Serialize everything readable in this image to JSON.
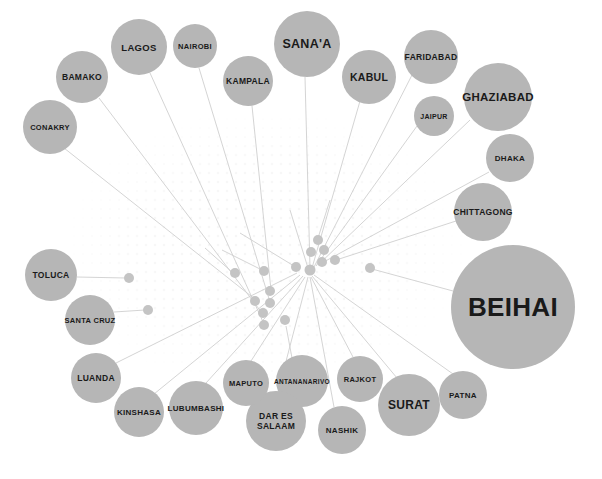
{
  "figure": {
    "type": "network-bubble-diagram",
    "width": 602,
    "height": 479,
    "background_color": "#ffffff",
    "node_color": "#b6b6b6",
    "minor_node_color": "#c4c4c4",
    "edge_color": "#cfcfcf",
    "label_color": "#1a1a1a"
  },
  "chart_data": {
    "type": "scatter",
    "title": "",
    "xlabel": "",
    "ylabel": "",
    "legend": [],
    "grid": false,
    "nodes": [
      {
        "label": "CONAKRY",
        "cx": 50,
        "cy": 127,
        "r": 27,
        "font": 7.5
      },
      {
        "label": "BAMAKO",
        "cx": 82,
        "cy": 77,
        "r": 26,
        "font": 8.5
      },
      {
        "label": "LAGOS",
        "cx": 139,
        "cy": 47,
        "r": 28,
        "font": 9.5
      },
      {
        "label": "NAIROBI",
        "cx": 195,
        "cy": 46,
        "r": 22,
        "font": 7.5
      },
      {
        "label": "KAMPALA",
        "cx": 248,
        "cy": 81,
        "r": 25,
        "font": 8.5
      },
      {
        "label": "SANA'A",
        "cx": 307,
        "cy": 44,
        "r": 33,
        "font": 12.5
      },
      {
        "label": "KABUL",
        "cx": 369,
        "cy": 77,
        "r": 27,
        "font": 10.5
      },
      {
        "label": "FARIDABAD",
        "cx": 431,
        "cy": 57,
        "r": 27,
        "font": 8.5
      },
      {
        "label": "JAIPUR",
        "cx": 434,
        "cy": 116,
        "r": 20,
        "font": 7.0
      },
      {
        "label": "GHAZIABAD",
        "cx": 498,
        "cy": 97,
        "r": 34,
        "font": 11.5
      },
      {
        "label": "DHAKA",
        "cx": 510,
        "cy": 158,
        "r": 24,
        "font": 8.0
      },
      {
        "label": "CHITTAGONG",
        "cx": 483,
        "cy": 212,
        "r": 29,
        "font": 8.5
      },
      {
        "label": "BEIHAI",
        "cx": 513,
        "cy": 307,
        "r": 62,
        "font": 26.0
      },
      {
        "label": "PATNA",
        "cx": 463,
        "cy": 395,
        "r": 24,
        "font": 8.0
      },
      {
        "label": "SURAT",
        "cx": 409,
        "cy": 405,
        "r": 31,
        "font": 12.0
      },
      {
        "label": "RAJKOT",
        "cx": 360,
        "cy": 379,
        "r": 23,
        "font": 7.5
      },
      {
        "label": "NASHIK",
        "cx": 342,
        "cy": 430,
        "r": 24,
        "font": 8.0
      },
      {
        "label": "ANTANANARIVO",
        "cx": 302,
        "cy": 381,
        "r": 26,
        "font": 6.5
      },
      {
        "label": "DAR ES SALAAM",
        "cx": 276,
        "cy": 421,
        "r": 30,
        "font": 8.5
      },
      {
        "label": "MAPUTO",
        "cx": 246,
        "cy": 383,
        "r": 23,
        "font": 7.5
      },
      {
        "label": "LUBUMBASHI",
        "cx": 196,
        "cy": 408,
        "r": 27,
        "font": 8.0
      },
      {
        "label": "KINSHASA",
        "cx": 139,
        "cy": 412,
        "r": 25,
        "font": 8.0
      },
      {
        "label": "LUANDA",
        "cx": 96,
        "cy": 378,
        "r": 25,
        "font": 8.5
      },
      {
        "label": "SANTA CRUZ",
        "cx": 90,
        "cy": 320,
        "r": 25,
        "font": 7.5
      },
      {
        "label": "TOLUCA",
        "cx": 51,
        "cy": 275,
        "r": 26,
        "font": 8.5
      }
    ],
    "minor_nodes": [
      {
        "cx": 318,
        "cy": 240,
        "r": 5.0
      },
      {
        "cx": 311,
        "cy": 252,
        "r": 5.0
      },
      {
        "cx": 324,
        "cy": 250,
        "r": 5.0
      },
      {
        "cx": 322,
        "cy": 262,
        "r": 5.0
      },
      {
        "cx": 335,
        "cy": 260,
        "r": 5.0
      },
      {
        "cx": 296,
        "cy": 267,
        "r": 5.0
      },
      {
        "cx": 310,
        "cy": 270,
        "r": 5.5
      },
      {
        "cx": 370,
        "cy": 268,
        "r": 5.0
      },
      {
        "cx": 235,
        "cy": 273,
        "r": 5.0
      },
      {
        "cx": 264,
        "cy": 271,
        "r": 5.0
      },
      {
        "cx": 129,
        "cy": 278,
        "r": 5.0
      },
      {
        "cx": 148,
        "cy": 310,
        "r": 5.0
      },
      {
        "cx": 270,
        "cy": 291,
        "r": 5.0
      },
      {
        "cx": 255,
        "cy": 301,
        "r": 5.0
      },
      {
        "cx": 270,
        "cy": 303,
        "r": 5.0
      },
      {
        "cx": 263,
        "cy": 313,
        "r": 5.0
      },
      {
        "cx": 264,
        "cy": 325,
        "r": 5.0
      },
      {
        "cx": 285,
        "cy": 320,
        "r": 5.0
      }
    ],
    "hub_center": {
      "cx": 310,
      "cy": 270
    },
    "edges": [
      {
        "from": "CONAKRY",
        "fx": 64,
        "fy": 148,
        "tx": 256,
        "ty": 300
      },
      {
        "from": "BAMAKO",
        "fx": 99,
        "fy": 98,
        "tx": 262,
        "ty": 313
      },
      {
        "from": "LAGOS",
        "fx": 150,
        "fy": 73,
        "tx": 264,
        "ty": 324
      },
      {
        "from": "NAIROBI",
        "fx": 199,
        "fy": 68,
        "tx": 270,
        "ty": 302
      },
      {
        "from": "KAMPALA",
        "fx": 252,
        "fy": 106,
        "tx": 271,
        "ty": 290
      },
      {
        "from": "SANA'A",
        "fx": 305,
        "fy": 77,
        "tx": 310,
        "ty": 268
      },
      {
        "from": "KABUL",
        "fx": 360,
        "fy": 101,
        "tx": 312,
        "ty": 268
      },
      {
        "from": "FARIDABAD",
        "fx": 412,
        "fy": 75,
        "tx": 314,
        "ty": 267
      },
      {
        "from": "JAIPUR",
        "fx": 417,
        "fy": 126,
        "tx": 316,
        "ty": 266
      },
      {
        "from": "GHAZIABAD",
        "fx": 470,
        "fy": 120,
        "tx": 318,
        "ty": 265
      },
      {
        "from": "DHAKA",
        "fx": 489,
        "fy": 172,
        "tx": 320,
        "ty": 264
      },
      {
        "from": "CHITTAGONG",
        "fx": 456,
        "fy": 221,
        "tx": 330,
        "ty": 262
      },
      {
        "from": "BEIHAI",
        "fx": 453,
        "fy": 291,
        "tx": 372,
        "ty": 269
      },
      {
        "from": "PATNA",
        "fx": 453,
        "fy": 374,
        "tx": 314,
        "ty": 275
      },
      {
        "from": "SURAT",
        "fx": 397,
        "fy": 378,
        "tx": 312,
        "ty": 276
      },
      {
        "from": "RAJKOT",
        "fx": 353,
        "fy": 357,
        "tx": 311,
        "ty": 277
      },
      {
        "from": "NASHIK",
        "fx": 334,
        "fy": 407,
        "tx": 310,
        "ty": 277
      },
      {
        "from": "ANTANANARIVO",
        "fx": 292,
        "fy": 358,
        "tx": 286,
        "ty": 326
      },
      {
        "from": "DAR ES SALAAM",
        "fx": 278,
        "fy": 392,
        "tx": 308,
        "ty": 277
      },
      {
        "from": "MAPUTO",
        "fx": 251,
        "fy": 361,
        "tx": 305,
        "ty": 277
      },
      {
        "from": "LUBUMBASHI",
        "fx": 206,
        "fy": 383,
        "tx": 303,
        "ty": 276
      },
      {
        "from": "KINSHASA",
        "fx": 154,
        "fy": 394,
        "tx": 300,
        "ty": 275
      },
      {
        "from": "LUANDA",
        "fx": 116,
        "fy": 363,
        "tx": 297,
        "ty": 273
      },
      {
        "from": "SANTA CRUZ",
        "fx": 114,
        "fy": 312,
        "tx": 145,
        "ty": 310
      },
      {
        "from": "TOLUCA",
        "fx": 77,
        "fy": 277,
        "tx": 126,
        "ty": 278
      },
      {
        "from": "hub-spoke-a",
        "fx": 232,
        "fy": 272,
        "tx": 205,
        "ty": 248
      },
      {
        "from": "hub-spoke-b",
        "fx": 262,
        "fy": 270,
        "tx": 222,
        "ty": 250
      },
      {
        "from": "hub-spoke-c",
        "fx": 294,
        "fy": 266,
        "tx": 240,
        "ty": 233
      },
      {
        "from": "hub-spoke-d",
        "fx": 308,
        "fy": 268,
        "tx": 290,
        "ty": 210
      },
      {
        "from": "hub-spoke-e",
        "fx": 318,
        "fy": 238,
        "tx": 330,
        "ty": 200
      }
    ]
  }
}
